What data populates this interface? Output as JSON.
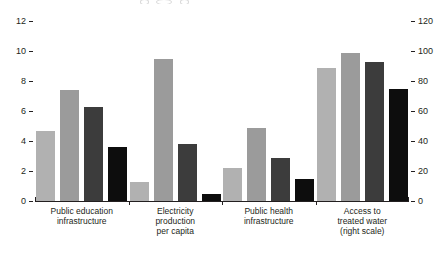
{
  "chart_data": {
    "type": "bar",
    "title": "",
    "xlabel": "",
    "ylabel": "",
    "grid": false,
    "legend": false,
    "categories": [
      "Public education infrastructure",
      "Electricity production per capita",
      "Public health infrastructure",
      "Access to treated water (right scale)"
    ],
    "category_label_lines": [
      [
        "Public education",
        "infrastructure"
      ],
      [
        "Electricity",
        "production",
        "per capita"
      ],
      [
        "Public health",
        "infrastructure"
      ],
      [
        "Access to",
        "treated water",
        "(right scale)"
      ]
    ],
    "category_scale": [
      "left",
      "left",
      "left",
      "right"
    ],
    "series": [
      {
        "name": "bar-1",
        "color": "#b1b1b1",
        "values": [
          4.7,
          1.3,
          2.2,
          89
        ]
      },
      {
        "name": "bar-2",
        "color": "#9b9b9b",
        "values": [
          7.4,
          9.5,
          4.9,
          99
        ]
      },
      {
        "name": "bar-3",
        "color": "#3c3c3c",
        "values": [
          6.3,
          3.8,
          2.9,
          93
        ]
      },
      {
        "name": "bar-4",
        "color": "#0d0d0d",
        "values": [
          3.6,
          0.5,
          1.5,
          75
        ]
      }
    ],
    "left_axis": {
      "min": 0,
      "max": 12,
      "ticks": [
        "12",
        "10",
        "8",
        "6",
        "4",
        "2",
        "0"
      ]
    },
    "right_axis": {
      "min": 0,
      "max": 120,
      "ticks": [
        "120",
        "100",
        "80",
        "60",
        "40",
        "20",
        "0"
      ]
    },
    "axis_color": "#231f20"
  }
}
